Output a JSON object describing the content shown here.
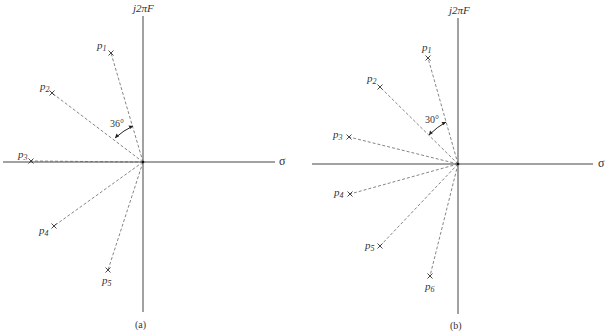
{
  "figures": [
    {
      "id": "a",
      "caption": "(a)",
      "vertical_axis_label": "j2πF",
      "horizontal_axis_label": "σ",
      "angle_label": "36°",
      "origin": [
        143,
        162
      ],
      "poles": [
        {
          "name": "p",
          "sub": "1",
          "x": 111,
          "y": 53
        },
        {
          "name": "p",
          "sub": "2",
          "x": 52,
          "y": 93
        },
        {
          "name": "p",
          "sub": "3",
          "x": 31,
          "y": 161
        },
        {
          "name": "p",
          "sub": "4",
          "x": 54,
          "y": 226
        },
        {
          "name": "p",
          "sub": "5",
          "x": 108,
          "y": 270
        }
      ]
    },
    {
      "id": "b",
      "caption": "(b)",
      "vertical_axis_label": "j2πF",
      "horizontal_axis_label": "σ",
      "angle_label": "30°",
      "origin": [
        458,
        164
      ],
      "poles": [
        {
          "name": "p",
          "sub": "1",
          "x": 428,
          "y": 58
        },
        {
          "name": "p",
          "sub": "2",
          "x": 380,
          "y": 87
        },
        {
          "name": "p",
          "sub": "3",
          "x": 349,
          "y": 137
        },
        {
          "name": "p",
          "sub": "4",
          "x": 350,
          "y": 194
        },
        {
          "name": "p",
          "sub": "5",
          "x": 380,
          "y": 246
        },
        {
          "name": "p",
          "sub": "6",
          "x": 430,
          "y": 276
        }
      ]
    }
  ],
  "colors": {
    "axis": "#444444",
    "dashed": "#666666",
    "text": "#333333"
  }
}
